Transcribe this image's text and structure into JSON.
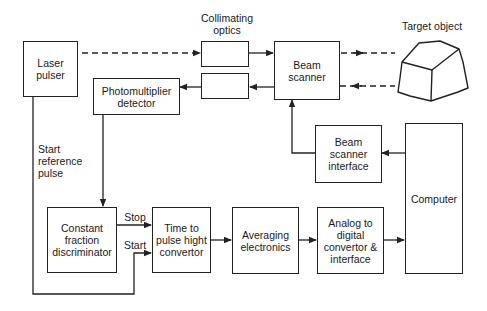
{
  "diagram": {
    "type": "block-diagram",
    "title": "",
    "blocks": {
      "laser_pulser": "Laser pulser",
      "collimating_optics_label": "Collimating optics",
      "collimating_optics_out": "",
      "collimating_optics_in": "",
      "photomultiplier": "Photomultiplier detector",
      "beam_scanner": "Beam scanner",
      "target_object": "Target object",
      "beam_scanner_interface": "Beam scanner interface",
      "computer": "Computer",
      "cfd": "Constant fraction discriminator",
      "tphc": "Time to pulse hight convertor",
      "averaging": "Averaging electronics",
      "adc": "Analog to digital convertor & interface"
    },
    "labels": {
      "start_reference_pulse": "Start reference pulse",
      "stop": "Stop",
      "start": "Start"
    },
    "connections": [
      {
        "from": "Laser pulser",
        "to": "Collimating optics (out)",
        "style": "dashed"
      },
      {
        "from": "Collimating optics (out)",
        "to": "Beam scanner",
        "style": "solid"
      },
      {
        "from": "Beam scanner",
        "to": "Target object",
        "style": "dashed"
      },
      {
        "from": "Target object",
        "to": "Beam scanner",
        "style": "dashed"
      },
      {
        "from": "Beam scanner",
        "to": "Collimating optics (in)",
        "style": "solid"
      },
      {
        "from": "Collimating optics (in)",
        "to": "Photomultiplier detector",
        "style": "solid"
      },
      {
        "from": "Photomultiplier detector",
        "to": "Constant fraction discriminator",
        "style": "solid"
      },
      {
        "from": "Constant fraction discriminator",
        "to": "Time to pulse hight convertor",
        "label": "Stop"
      },
      {
        "from": "Laser pulser",
        "to": "Time to pulse hight convertor",
        "label": "Start"
      },
      {
        "from": "Time to pulse hight convertor",
        "to": "Averaging electronics"
      },
      {
        "from": "Averaging electronics",
        "to": "Analog to digital convertor & interface"
      },
      {
        "from": "Analog to digital convertor & interface",
        "to": "Computer"
      },
      {
        "from": "Computer",
        "to": "Beam scanner interface"
      },
      {
        "from": "Beam scanner interface",
        "to": "Beam scanner"
      }
    ],
    "colors": {
      "line": "#222222",
      "background": "#ffffff"
    }
  }
}
